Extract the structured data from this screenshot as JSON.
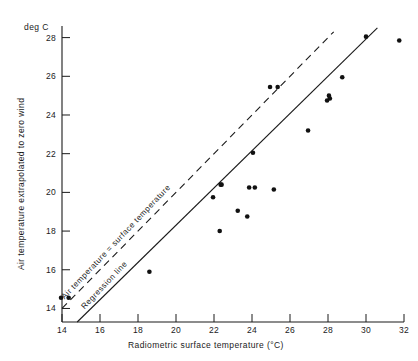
{
  "chart_data": {
    "type": "scatter",
    "title": "",
    "xlabel": "Radiometric surface temperature (°C)",
    "ylabel": "Air temperature extrapolated to zero wind",
    "unit_label": "deg C",
    "xlim": [
      14,
      32
    ],
    "ylim": [
      13.3,
      28.6
    ],
    "xticks": [
      14,
      16,
      18,
      20,
      22,
      24,
      26,
      28,
      30,
      32
    ],
    "yticks": [
      14,
      16,
      18,
      20,
      22,
      24,
      26,
      28
    ],
    "xtick_labels": [
      "14",
      "16",
      "18",
      "20",
      "22",
      "24",
      "26",
      "28",
      "30",
      "32"
    ],
    "ytick_labels": [
      "14",
      "16",
      "18",
      "20",
      "22",
      "24",
      "26",
      "28"
    ],
    "grid": false,
    "legend": "inline-line-labels",
    "points": [
      {
        "x": 13.95,
        "y": 14.55
      },
      {
        "x": 14.35,
        "y": 14.55
      },
      {
        "x": 18.6,
        "y": 15.9
      },
      {
        "x": 22.3,
        "y": 18.0
      },
      {
        "x": 21.95,
        "y": 19.75
      },
      {
        "x": 22.35,
        "y": 20.4
      },
      {
        "x": 22.4,
        "y": 20.4
      },
      {
        "x": 23.25,
        "y": 19.05
      },
      {
        "x": 23.85,
        "y": 20.25
      },
      {
        "x": 24.15,
        "y": 20.25
      },
      {
        "x": 23.75,
        "y": 18.75
      },
      {
        "x": 24.05,
        "y": 22.05
      },
      {
        "x": 25.15,
        "y": 20.15
      },
      {
        "x": 24.95,
        "y": 25.45
      },
      {
        "x": 25.35,
        "y": 25.45
      },
      {
        "x": 26.95,
        "y": 23.2
      },
      {
        "x": 27.95,
        "y": 24.75
      },
      {
        "x": 28.05,
        "y": 25.0
      },
      {
        "x": 28.1,
        "y": 24.85
      },
      {
        "x": 28.75,
        "y": 25.95
      },
      {
        "x": 30.0,
        "y": 28.05
      },
      {
        "x": 31.75,
        "y": 27.85
      }
    ],
    "lines": [
      {
        "name": "Air temperature = surface temperature",
        "style": "dashed",
        "x0": 14.0,
        "y0": 14.0,
        "x1": 28.3,
        "y1": 28.3
      },
      {
        "name": "Regression line",
        "style": "solid",
        "x0": 14.8,
        "y0": 13.3,
        "x1": 30.6,
        "y1": 28.5
      }
    ],
    "line_labels": {
      "identity": "Air  temperature  =  surface  temperature",
      "regression": "Regression   line"
    },
    "colors": {
      "axis": "#1a1a1a",
      "point": "#111111",
      "line": "#1a1a1a",
      "background": "#ffffff"
    }
  }
}
